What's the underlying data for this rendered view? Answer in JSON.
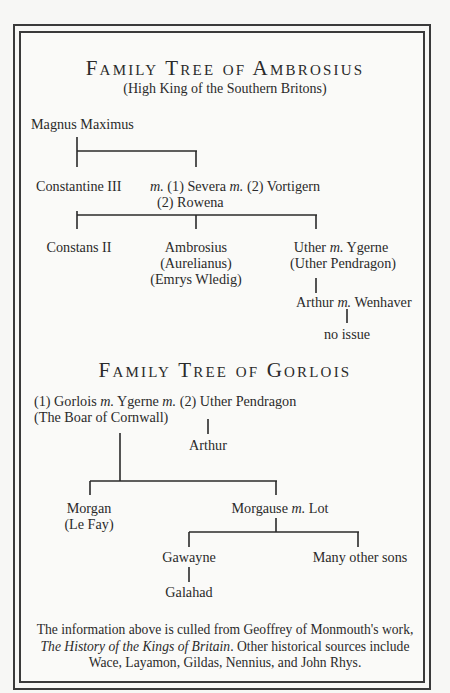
{
  "tree1": {
    "title": "Family Tree of Ambrosius",
    "subtitle": "(High King of the Southern Britons)",
    "magnus": "Magnus Maximus",
    "constantine": "Constantine III",
    "marriage_line1_m1": "m.",
    "marriage_line1_a": "(1) Severa",
    "marriage_line1_m2": "m.",
    "marriage_line1_b": "(2) Vortigern",
    "marriage_line2": "(2) Rowena",
    "constans": "Constans II",
    "ambrosius": [
      "Ambrosius",
      "(Aurelianus)",
      "(Emrys Wledig)"
    ],
    "uther_name": "Uther",
    "uther_m": "m.",
    "uther_spouse": "Ygerne",
    "uther_alias": "(Uther Pendragon)",
    "arthur": "Arthur",
    "arthur_m": "m.",
    "arthur_spouse": "Wenhaver",
    "no_issue": "no issue"
  },
  "tree2": {
    "title": "Family Tree of Gorlois",
    "gorlois": "(1) Gorlois",
    "m1": "m.",
    "ygerne": "Ygerne",
    "m2": "m.",
    "uther": "(2) Uther Pendragon",
    "gorlois_alias": "(The Boar of Cornwall)",
    "arthur": "Arthur",
    "morgan": [
      "Morgan",
      "(Le Fay)"
    ],
    "morgause": "Morgause",
    "morgause_m": "m.",
    "lot": "Lot",
    "gawayne": "Gawayne",
    "many_sons": "Many other sons",
    "galahad": "Galahad"
  },
  "note": {
    "line1": "The information above is culled from Geoffrey of Monmouth's work,",
    "line2_italic": "The History of the Kings of Britain",
    "line2_rest": ". Other historical sources include",
    "line3": "Wace, Layamon, Gildas, Nennius, and John Rhys."
  }
}
